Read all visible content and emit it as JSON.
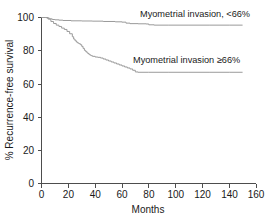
{
  "chart_data": {
    "type": "line",
    "title": "",
    "subtitle": "",
    "xlabel": "Months",
    "ylabel": "% Recurrence-free survival",
    "xlim": [
      0,
      160
    ],
    "ylim": [
      0,
      100
    ],
    "xticks": [
      0,
      20,
      40,
      60,
      80,
      100,
      120,
      140,
      160
    ],
    "yticks": [
      0,
      20,
      40,
      60,
      80,
      100
    ],
    "xtick_labels": [
      "0",
      "20",
      "40",
      "60",
      "80",
      "100",
      "120",
      "140",
      "160"
    ],
    "ytick_labels": [
      "0",
      "20",
      "40",
      "60",
      "80",
      "100"
    ],
    "grid": false,
    "legend_position": "inline-annotation",
    "curve_color": "#9a9a9a",
    "axis_color": "#4d4d4d",
    "text_color": "#1a1a1a",
    "series": [
      {
        "name": "Myometrial invasion, <66%",
        "label": "Myometrial invasion, <66%",
        "annotation_x": 85,
        "annotation_y": 100,
        "step_points": [
          [
            0,
            100.0
          ],
          [
            3,
            100.0
          ],
          [
            4,
            99.6
          ],
          [
            6,
            99.2
          ],
          [
            8,
            98.8
          ],
          [
            10,
            98.6
          ],
          [
            13,
            98.4
          ],
          [
            16,
            98.2
          ],
          [
            22,
            98.0
          ],
          [
            30,
            97.9
          ],
          [
            38,
            97.8
          ],
          [
            46,
            97.6
          ],
          [
            55,
            97.4
          ],
          [
            60,
            97.2
          ],
          [
            63,
            96.6
          ],
          [
            66,
            96.3
          ],
          [
            72,
            96.2
          ],
          [
            78,
            96.1
          ],
          [
            80,
            95.6
          ],
          [
            84,
            95.4
          ],
          [
            95,
            95.4
          ],
          [
            110,
            95.4
          ],
          [
            125,
            95.4
          ],
          [
            140,
            95.4
          ],
          [
            150,
            95.4
          ]
        ]
      },
      {
        "name": "Myometrial invasion ≥66%",
        "label": "Myometrial invasion ≥66%",
        "annotation_x": 80,
        "annotation_y": 75,
        "step_points": [
          [
            0,
            100.0
          ],
          [
            3,
            100.0
          ],
          [
            5,
            99.0
          ],
          [
            7,
            97.6
          ],
          [
            9,
            96.4
          ],
          [
            11,
            95.4
          ],
          [
            13,
            94.6
          ],
          [
            15,
            93.6
          ],
          [
            17,
            92.8
          ],
          [
            19,
            91.6
          ],
          [
            21,
            90.2
          ],
          [
            23,
            88.4
          ],
          [
            24,
            87.0
          ],
          [
            25,
            86.0
          ],
          [
            26,
            85.2
          ],
          [
            27,
            84.6
          ],
          [
            28,
            84.2
          ],
          [
            29,
            83.6
          ],
          [
            30,
            82.6
          ],
          [
            31,
            81.4
          ],
          [
            32,
            80.2
          ],
          [
            33,
            79.4
          ],
          [
            34,
            78.6
          ],
          [
            35,
            78.0
          ],
          [
            36,
            77.4
          ],
          [
            37,
            77.0
          ],
          [
            38,
            76.6
          ],
          [
            40,
            76.2
          ],
          [
            42,
            76.0
          ],
          [
            44,
            75.6
          ],
          [
            46,
            75.0
          ],
          [
            48,
            74.4
          ],
          [
            50,
            73.8
          ],
          [
            52,
            73.2
          ],
          [
            54,
            72.6
          ],
          [
            56,
            72.0
          ],
          [
            58,
            71.4
          ],
          [
            60,
            70.8
          ],
          [
            62,
            70.2
          ],
          [
            64,
            69.6
          ],
          [
            66,
            69.0
          ],
          [
            68,
            68.2
          ],
          [
            70,
            67.2
          ],
          [
            72,
            67.0
          ],
          [
            80,
            67.0
          ],
          [
            95,
            67.0
          ],
          [
            110,
            67.0
          ],
          [
            125,
            67.0
          ],
          [
            140,
            67.0
          ],
          [
            150,
            67.0
          ]
        ]
      }
    ]
  },
  "figure": {
    "xlabel": "Months",
    "ylabel": "% Recurrence-free survival",
    "label_high": "Myometrial invasion, <66%",
    "label_low": "Myometrial invasion ≥66%"
  }
}
